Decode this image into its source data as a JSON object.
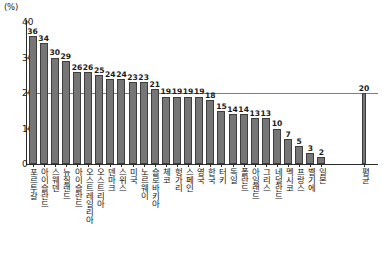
{
  "chart_data": {
    "type": "bar",
    "title": "",
    "xlabel": "",
    "ylabel": "",
    "y_unit_label": "(%)",
    "ylim": [
      0,
      40
    ],
    "yticks": [
      0,
      10,
      20,
      30,
      40
    ],
    "grid": false,
    "legend": "none",
    "reference_line": {
      "value": 20,
      "label": ""
    },
    "categories": [
      "포르투갈",
      "아이슬란드",
      "스웨덴",
      "뉴질랜드",
      "아이슬란드",
      "오스트레일리아",
      "오스트리아",
      "덴마크",
      "스위스",
      "미국",
      "노르웨이",
      "슬로바키아",
      "체코",
      "헝가리",
      "스페인",
      "영국",
      "한국",
      "터키",
      "독일",
      "폴란드",
      "아일랜드",
      "그리스",
      "네덜란드",
      "멕시코",
      "프랑스",
      "벨기에",
      "일본",
      "평균"
    ],
    "values": [
      36,
      34,
      30,
      29,
      26,
      26,
      25,
      24,
      24,
      23,
      23,
      21,
      19,
      19,
      19,
      19,
      18,
      15,
      14,
      14,
      13,
      13,
      10,
      7,
      5,
      3,
      2,
      20
    ],
    "value_labels": [
      "36",
      "34",
      "30",
      "29",
      "26",
      "26",
      "25",
      "24",
      "24",
      "23",
      "23",
      "21",
      "19",
      "19",
      "19",
      "19",
      "18",
      "15",
      "14",
      "14",
      "13",
      "13",
      "10",
      "7",
      "5",
      "3",
      "2",
      "20"
    ],
    "colors": {
      "bar_fill": "#767676",
      "bar_stroke": "#3d3d3d",
      "axis": "#2b2b2b",
      "reference_line": "#7e7e7e",
      "background": "#ffffff"
    }
  }
}
